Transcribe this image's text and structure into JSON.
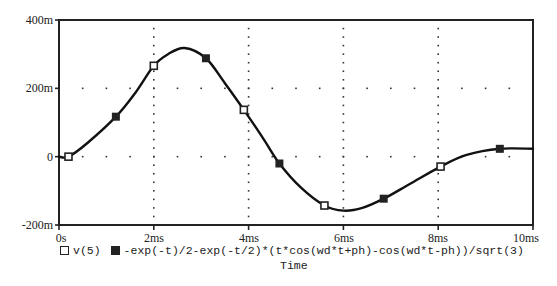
{
  "chart_data": {
    "type": "line",
    "title": "",
    "xlabel": "Time",
    "ylabel": "",
    "xlim": [
      0,
      10
    ],
    "xunit": "ms",
    "ylim": [
      -200,
      400
    ],
    "yunit": "m",
    "x_ticks": [
      "0s",
      "2ms",
      "4ms",
      "6ms",
      "8ms",
      "10ms"
    ],
    "y_ticks": [
      "400m",
      "200m",
      "0",
      "-200m"
    ],
    "grid": "dotted",
    "legend_position": "bottom",
    "series": [
      {
        "name": "v(5)",
        "marker": "open-square",
        "x": [
          0.2,
          2.0,
          3.9,
          5.6,
          8.05
        ],
        "y": [
          0,
          266,
          137,
          -143,
          -29
        ]
      },
      {
        "name": "-exp(-t)/2-exp(-t/2)*(t*cos(wd*t+ph)-cos(wd*t-ph))/sqrt(3)",
        "marker": "filled-square",
        "x": [
          1.2,
          3.1,
          4.65,
          6.85,
          9.3
        ],
        "y": [
          117,
          288,
          -20,
          -123,
          23
        ]
      }
    ],
    "curve": {
      "x": [
        0,
        0.2,
        0.6,
        1.2,
        1.6,
        2.0,
        2.3,
        2.65,
        3.1,
        3.5,
        3.9,
        4.3,
        4.65,
        5.1,
        5.6,
        6.0,
        6.4,
        6.85,
        7.4,
        8.05,
        8.6,
        9.3,
        10.0
      ],
      "y": [
        0,
        0,
        40,
        117,
        185,
        266,
        300,
        318,
        288,
        215,
        137,
        55,
        -20,
        -90,
        -143,
        -158,
        -150,
        -123,
        -80,
        -29,
        5,
        23,
        23
      ]
    }
  },
  "legend": {
    "series1_label": "v(5)",
    "series2_label": "-exp(-t)/2-exp(-t/2)*(t*cos(wd*t+ph)-cos(wd*t-ph))/sqrt(3)"
  },
  "axes": {
    "xlabel": "Time",
    "x_ticks": [
      "0s",
      "2ms",
      "4ms",
      "6ms",
      "8ms",
      "10ms"
    ],
    "y_ticks": [
      "400m",
      "200m",
      "0",
      "-200m"
    ]
  }
}
